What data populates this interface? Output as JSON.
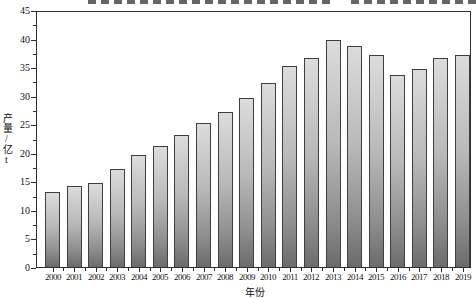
{
  "chart_data": {
    "type": "bar",
    "title": "",
    "categories": [
      "2000",
      "2001",
      "2002",
      "2003",
      "2004",
      "2005",
      "2006",
      "2007",
      "2008",
      "2009",
      "2010",
      "2011",
      "2012",
      "2013",
      "2014",
      "2015",
      "2016",
      "2017",
      "2018",
      "2019"
    ],
    "values": [
      13,
      14,
      14.5,
      17,
      19.5,
      21,
      23,
      25,
      27,
      29.5,
      32,
      35,
      36.5,
      39.5,
      38.5,
      37,
      33.5,
      34.5,
      36.5,
      37
    ],
    "xlabel": "年份",
    "ylabel": "产量/亿t",
    "ylim": [
      0,
      45
    ],
    "ytick_step": 5,
    "yminor_step": 2.5,
    "grid": false,
    "legend_position": "none",
    "bar_color_top": "#dcdcdc",
    "bar_color_bottom": "#6b6b6b",
    "bar_border_color": "#3f3f3f",
    "axis_color": "#2e2e2e"
  }
}
